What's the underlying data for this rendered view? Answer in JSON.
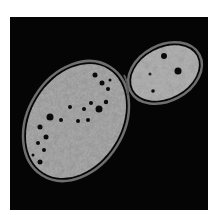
{
  "image": {
    "subject": "budding yeast cell micrograph",
    "description": "Grayscale electron micrograph of a large oval mother cell with a smaller budding daughter cell attached at upper right, on black background",
    "colors": {
      "background": "#050505",
      "margin": "#ffffff",
      "cytoplasm": "#9a9a9a",
      "cell_wall": "#7a7a7a",
      "vacuole": "#0a0a0a"
    }
  }
}
